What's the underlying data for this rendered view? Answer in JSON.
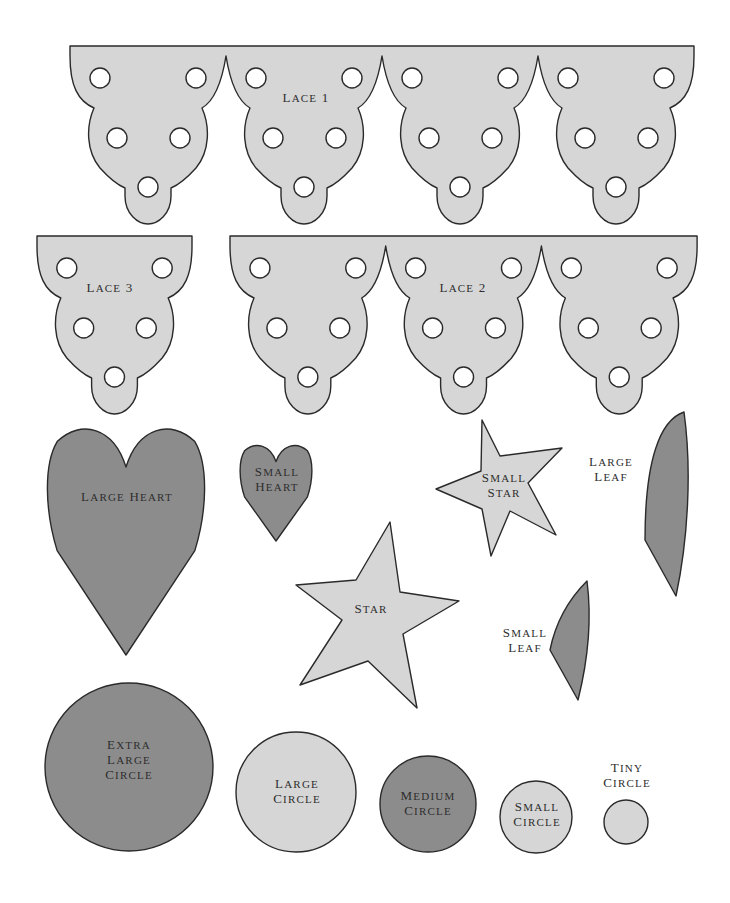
{
  "colors": {
    "light_fill": "#d6d6d6",
    "dark_fill": "#8c8c8c",
    "outline": "#2a2a2a",
    "background": "#ffffff"
  },
  "laces": [
    {
      "name": "lace-1",
      "label": "Lace 1",
      "x": 70,
      "y": 46,
      "units": 4,
      "unit_width": 156,
      "label_pos": [
        306,
        102
      ]
    },
    {
      "name": "lace-2",
      "label": "Lace 2",
      "x": 230,
      "y": 236,
      "units": 3,
      "unit_width": 155.7,
      "label_pos": [
        463,
        292
      ]
    },
    {
      "name": "lace-3",
      "label": "Lace 3",
      "x": 37,
      "y": 236,
      "units": 1,
      "unit_width": 155,
      "label_pos": [
        110,
        292
      ]
    }
  ],
  "shapes": [
    {
      "name": "large-heart",
      "type": "heart",
      "fill": "dark",
      "label": [
        "Large Heart"
      ],
      "cx": 126,
      "top": 423,
      "w": 162,
      "h": 232,
      "label_pos": [
        127,
        501
      ]
    },
    {
      "name": "small-heart",
      "type": "heart",
      "fill": "dark",
      "label": [
        "Small",
        "Heart"
      ],
      "cx": 276,
      "top": 443,
      "w": 74,
      "h": 98,
      "label_pos": [
        277,
        476
      ]
    },
    {
      "name": "small-star",
      "type": "star",
      "fill": "light",
      "label": [
        "Small",
        "Star"
      ],
      "points": [
        [
          482,
          420
        ],
        [
          500,
          456
        ],
        [
          562,
          448
        ],
        [
          528,
          483
        ],
        [
          556,
          535
        ],
        [
          510,
          511
        ],
        [
          491,
          556
        ],
        [
          482,
          509
        ],
        [
          436,
          489
        ],
        [
          481,
          471
        ]
      ],
      "label_pos": [
        504,
        482
      ]
    },
    {
      "name": "star",
      "type": "star",
      "fill": "light",
      "label": [
        "Star"
      ],
      "points": [
        [
          390,
          522
        ],
        [
          400,
          592
        ],
        [
          459,
          601
        ],
        [
          403,
          634
        ],
        [
          417,
          708
        ],
        [
          368,
          661
        ],
        [
          300,
          685
        ],
        [
          342,
          620
        ],
        [
          296,
          585
        ],
        [
          356,
          580
        ]
      ],
      "label_pos": [
        371,
        613
      ]
    },
    {
      "name": "large-leaf",
      "type": "leaf",
      "fill": "dark",
      "label": [
        "Large",
        "Leaf"
      ],
      "path": "M684,412 C660,420 645,460 645,540 L676,596 C688,540 692,470 684,412 Z",
      "label_pos": [
        611,
        466
      ]
    },
    {
      "name": "small-leaf",
      "type": "leaf",
      "fill": "dark",
      "label": [
        "Small",
        "Leaf"
      ],
      "path": "M587,581 C568,600 555,625 550,650 L578,700 C588,660 592,620 587,581 Z",
      "label_pos": [
        525,
        637
      ]
    },
    {
      "name": "extra-large-circle",
      "type": "circle",
      "fill": "dark",
      "label": [
        "Extra",
        "Large",
        "Circle"
      ],
      "cx": 129,
      "cy": 767,
      "r": 84,
      "label_pos": [
        129,
        749
      ]
    },
    {
      "name": "large-circle",
      "type": "circle",
      "fill": "light",
      "label": [
        "Large",
        "Circle"
      ],
      "cx": 296,
      "cy": 792,
      "r": 60,
      "label_pos": [
        297,
        788
      ]
    },
    {
      "name": "medium-circle",
      "type": "circle",
      "fill": "dark",
      "label": [
        "Medium",
        "Circle"
      ],
      "cx": 428,
      "cy": 804,
      "r": 48,
      "label_pos": [
        428,
        800
      ]
    },
    {
      "name": "small-circle",
      "type": "circle",
      "fill": "light",
      "label": [
        "Small",
        "Circle"
      ],
      "cx": 536,
      "cy": 817,
      "r": 36,
      "label_pos": [
        537,
        811
      ]
    },
    {
      "name": "tiny-circle",
      "type": "circle",
      "fill": "light",
      "label": [
        "Tiny",
        "Circle"
      ],
      "cx": 626,
      "cy": 822,
      "r": 22,
      "label_pos": [
        627,
        772
      ]
    }
  ]
}
